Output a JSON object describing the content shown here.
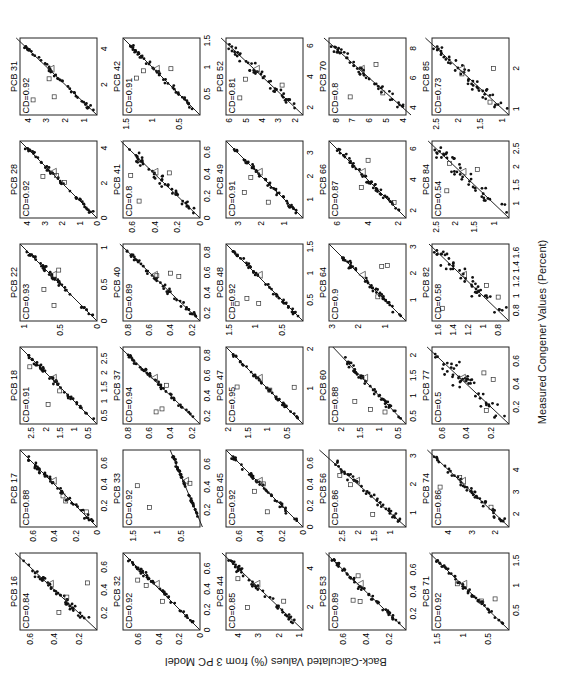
{
  "figure": {
    "ylabel": "Back-Calculated Values (%) from 3 PC Model",
    "xlabel": "Measured Congener Values (Percent)",
    "orientation": "rotated 90 degrees counter-clockwise"
  },
  "chart_data": {
    "type": "scatter",
    "title": "",
    "xlabel": "Measured Congener Values (Percent)",
    "ylabel": "Back-Calculated Values (%) from 3 PC Model",
    "layout": {
      "rows": 5,
      "cols": 6
    },
    "legend": {
      "filled_dot": "samples",
      "open_square": "outlier samples",
      "open_triangle": "outlier sample"
    },
    "panels": [
      {
        "name": "PCB 16",
        "cd": "CD=0.84",
        "xticks": [
          "0.2",
          "0.4",
          "0.6"
        ],
        "yticks": [
          "0.2",
          "0.4",
          "0.6"
        ],
        "xlim": [
          0.05,
          0.72
        ],
        "ylim": [
          0.05,
          0.68
        ]
      },
      {
        "name": "PCB 17",
        "cd": "CD=0.88",
        "xticks": [
          "0.2",
          "0.4",
          "0.6"
        ],
        "yticks": [
          "0",
          "0.2",
          "0.4",
          "0.6"
        ],
        "xlim": [
          0,
          0.72
        ],
        "ylim": [
          0,
          0.72
        ]
      },
      {
        "name": "PCB 18",
        "cd": "CD=0.91",
        "xticks": [
          "0.5",
          "1",
          "1.5",
          "2",
          "2.5"
        ],
        "yticks": [
          "0.5",
          "1",
          "1.5",
          "2",
          "2.5"
        ],
        "xlim": [
          0.2,
          2.9
        ],
        "ylim": [
          0.2,
          2.9
        ]
      },
      {
        "name": "PCB 22",
        "cd": "CD=0.93",
        "xticks": [
          "0",
          "0.5",
          "1"
        ],
        "yticks": [
          "0",
          "0.5",
          "1"
        ],
        "xlim": [
          0,
          1.05
        ],
        "ylim": [
          0,
          1.05
        ]
      },
      {
        "name": "PCB 28",
        "cd": "CD=0.92",
        "xticks": [
          "0",
          "2",
          "4"
        ],
        "yticks": [
          "0",
          "1",
          "2",
          "3",
          "4"
        ],
        "xlim": [
          0,
          4.4
        ],
        "ylim": [
          0,
          4.4
        ]
      },
      {
        "name": "PCB 31",
        "cd": "CD=0.92",
        "xticks": [
          "2",
          "4"
        ],
        "yticks": [
          "1",
          "2",
          "3",
          "4"
        ],
        "xlim": [
          0.3,
          4.6
        ],
        "ylim": [
          0.3,
          4.4
        ]
      },
      {
        "name": "PCB 32",
        "cd": "CD=0.92",
        "xticks": [
          "0",
          "0.2",
          "0.4",
          "0.6"
        ],
        "yticks": [
          "0",
          "0.2",
          "0.4",
          "0.6"
        ],
        "xlim": [
          0,
          0.75
        ],
        "ylim": [
          0,
          0.75
        ]
      },
      {
        "name": "PCB 33",
        "cd": "CD=0.92",
        "xticks": [
          "0.2",
          "0.4",
          "0.6"
        ],
        "yticks": [
          "0.5",
          "1",
          "1.5"
        ],
        "xlim": [
          0.05,
          0.72
        ],
        "ylim": [
          0.1,
          1.7
        ]
      },
      {
        "name": "PCB 37",
        "cd": "CD=0.94",
        "xticks": [
          "0.2",
          "0.4",
          "0.6",
          "0.8"
        ],
        "yticks": [
          "0.2",
          "0.4",
          "0.6",
          "0.8"
        ],
        "xlim": [
          0.12,
          0.88
        ],
        "ylim": [
          0.12,
          0.85
        ]
      },
      {
        "name": "PCB 40",
        "cd": "CD=0.89",
        "xticks": [
          "0.2",
          "0.4",
          "0.6",
          "0.8"
        ],
        "yticks": [
          "0.2",
          "0.4",
          "0.6",
          "0.8"
        ],
        "xlim": [
          0.12,
          0.88
        ],
        "ylim": [
          0.12,
          0.85
        ]
      },
      {
        "name": "PCB 41",
        "cd": "CD=0.8",
        "xticks": [
          "0",
          "0.2",
          "0.4",
          "0.6"
        ],
        "yticks": [
          "0",
          "0.2",
          "0.4",
          "0.6"
        ],
        "xlim": [
          0,
          0.7
        ],
        "ylim": [
          0,
          0.68
        ]
      },
      {
        "name": "PCB 42",
        "cd": "CD=0.91",
        "xticks": [
          "0.5",
          "1",
          "1.5"
        ],
        "yticks": [
          "0.5",
          "1",
          "1.5"
        ],
        "xlim": [
          0.1,
          1.55
        ],
        "ylim": [
          0.1,
          1.55
        ]
      },
      {
        "name": "PCB 44",
        "cd": "CD=0.85",
        "xticks": [
          "2",
          "4"
        ],
        "yticks": [
          "1",
          "2",
          "3",
          "4"
        ],
        "xlim": [
          0.8,
          4.8
        ],
        "ylim": [
          0.8,
          4.6
        ]
      },
      {
        "name": "PCB 45",
        "cd": "CD=0.92",
        "xticks": [
          "0",
          "0.2",
          "0.4",
          "0.6"
        ],
        "yticks": [
          "0",
          "0.2",
          "0.4",
          "0.6"
        ],
        "xlim": [
          0,
          0.72
        ],
        "ylim": [
          0,
          0.72
        ]
      },
      {
        "name": "PCB 47",
        "cd": "CD=0.95",
        "xticks": [
          "1",
          "2"
        ],
        "yticks": [
          "0.5",
          "1",
          "1.5",
          "2"
        ],
        "xlim": [
          0.1,
          2.05
        ],
        "ylim": [
          0.1,
          2.05
        ]
      },
      {
        "name": "PCB 48",
        "cd": "CD=0.92",
        "xticks": [
          "0.5",
          "1",
          "1.5"
        ],
        "yticks": [
          "0.5",
          "1",
          "1.5"
        ],
        "xlim": [
          0.1,
          1.55
        ],
        "ylim": [
          0.1,
          1.55
        ]
      },
      {
        "name": "PCB 49",
        "cd": "CD=0.91",
        "xticks": [
          "1",
          "2",
          "3"
        ],
        "yticks": [
          "1",
          "2",
          "3"
        ],
        "xlim": [
          0.2,
          3.5
        ],
        "ylim": [
          0.2,
          3.5
        ]
      },
      {
        "name": "PCB 52",
        "cd": "CD=0.81",
        "xticks": [
          "2",
          "4",
          "6"
        ],
        "yticks": [
          "2",
          "3",
          "4",
          "5",
          "6"
        ],
        "xlim": [
          1.5,
          6.5
        ],
        "ylim": [
          1.5,
          6.2
        ]
      },
      {
        "name": "PCB 53",
        "cd": "CD=0.89",
        "xticks": [
          "0.2",
          "0.4",
          "0.6"
        ],
        "yticks": [
          "0.2",
          "0.4",
          "0.6"
        ],
        "xlim": [
          0.05,
          0.75
        ],
        "ylim": [
          0.05,
          0.72
        ]
      },
      {
        "name": "PCB 56",
        "cd": "CD=0.86",
        "xticks": [
          "1",
          "2",
          "3"
        ],
        "yticks": [
          "1",
          "1.5",
          "2",
          "2.5"
        ],
        "xlim": [
          0.5,
          3.2
        ],
        "ylim": [
          0.5,
          2.9
        ]
      },
      {
        "name": "PCB 60",
        "cd": "CD=0.88",
        "xticks": [
          "0.5",
          "1",
          "1.5",
          "2"
        ],
        "yticks": [
          "0.5",
          "1",
          "1.5",
          "2"
        ],
        "xlim": [
          0.3,
          2.2
        ],
        "ylim": [
          0.3,
          2.3
        ]
      },
      {
        "name": "PCB 64",
        "cd": "CD=0.9",
        "xticks": [
          "1",
          "2",
          "3"
        ],
        "yticks": [
          "1",
          "2",
          "3"
        ],
        "xlim": [
          0.2,
          3.1
        ],
        "ylim": [
          0.2,
          3.1
        ]
      },
      {
        "name": "PCB 66",
        "cd": "CD=0.87",
        "xticks": [
          "2",
          "4",
          "6"
        ],
        "yticks": [
          "2",
          "4",
          "6"
        ],
        "xlim": [
          1.5,
          6.5
        ],
        "ylim": [
          1.5,
          6.5
        ]
      },
      {
        "name": "PCB 70",
        "cd": "CD=0.8",
        "xticks": [
          "4",
          "6",
          "8"
        ],
        "yticks": [
          "4",
          "5",
          "6",
          "7",
          "8"
        ],
        "xlim": [
          3.5,
          8.7
        ],
        "ylim": [
          3.8,
          8.4
        ]
      },
      {
        "name": "PCB 71",
        "cd": "CD=0.92",
        "xticks": [
          "0.5",
          "1",
          "1.5"
        ],
        "yticks": [
          "0.5",
          "1",
          "1.5"
        ],
        "xlim": [
          0.1,
          1.65
        ],
        "ylim": [
          0.1,
          1.6
        ]
      },
      {
        "name": "PCB 74",
        "cd": "CD=0.86",
        "xticks": [
          "2",
          "3",
          "4"
        ],
        "yticks": [
          "2",
          "3",
          "4"
        ],
        "xlim": [
          1.4,
          4.9
        ],
        "ylim": [
          1.4,
          4.7
        ]
      },
      {
        "name": "PCB 77",
        "cd": "CD=0.5",
        "xticks": [
          "0.2",
          "0.4",
          "0.6"
        ],
        "yticks": [
          "0.2",
          "0.4",
          "0.6"
        ],
        "xlim": [
          0.05,
          0.72
        ],
        "ylim": [
          0.05,
          0.68
        ]
      },
      {
        "name": "PCB 82",
        "cd": "CD=0.58",
        "xticks": [
          "0.8",
          "1",
          "1.2",
          "1.4",
          "1.6"
        ],
        "yticks": [
          "0.8",
          "1",
          "1.2",
          "1.4",
          "1.6"
        ],
        "xlim": [
          0.65,
          1.72
        ],
        "ylim": [
          0.65,
          1.68
        ]
      },
      {
        "name": "PCB 84",
        "cd": "CD=0.54",
        "xticks": [
          "1",
          "1.5",
          "2",
          "2.5"
        ],
        "yticks": [
          "1",
          "1.5",
          "2",
          "2.5"
        ],
        "xlim": [
          0.6,
          2.7
        ],
        "ylim": [
          0.6,
          2.6
        ]
      },
      {
        "name": "PCB 85",
        "cd": "CD=0.73",
        "xticks": [
          "1",
          "2"
        ],
        "yticks": [
          "1",
          "1.5",
          "2",
          "2.5"
        ],
        "xlim": [
          0.85,
          2.75
        ],
        "ylim": [
          0.85,
          2.6
        ]
      }
    ]
  }
}
